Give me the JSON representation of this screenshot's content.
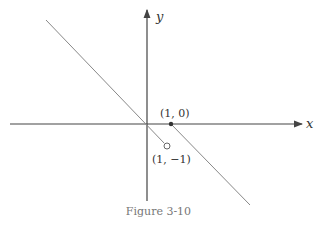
{
  "figure": {
    "caption": "Figure 3-10",
    "x_axis_label": "x",
    "y_axis_label": "y",
    "points": [
      {
        "label": "(1, 0)",
        "type": "filled"
      },
      {
        "label": "(1, −1)",
        "type": "open"
      }
    ],
    "colors": {
      "axis": "#444444",
      "line": "#777777",
      "text": "#333333"
    }
  }
}
